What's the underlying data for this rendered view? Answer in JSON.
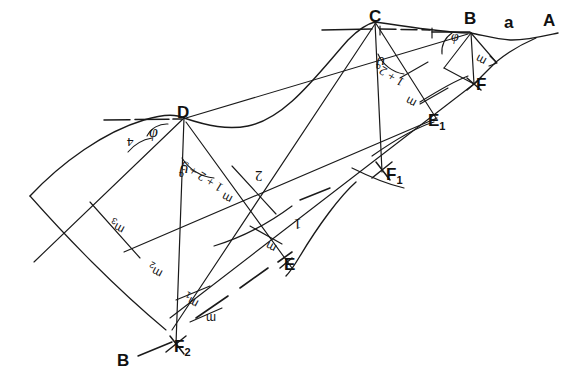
{
  "diagram": {
    "background_color": "#ffffff",
    "ink_color": "#1a1a1a",
    "points": [
      {
        "name": "A",
        "label": "A",
        "x": 545,
        "y": 22
      },
      {
        "name": "a",
        "label": "a",
        "x": 505,
        "y": 24
      },
      {
        "name": "B_top",
        "label": "B",
        "x": 470,
        "y": 20
      },
      {
        "name": "C",
        "label": "C",
        "x": 375,
        "y": 18
      },
      {
        "name": "D",
        "label": "D",
        "x": 183,
        "y": 114
      },
      {
        "name": "E",
        "label": "E",
        "x": 288,
        "y": 266
      },
      {
        "name": "E1",
        "label": "E",
        "sub": "1",
        "x": 432,
        "y": 122
      },
      {
        "name": "F",
        "label": "F",
        "x": 480,
        "y": 86
      },
      {
        "name": "F1",
        "label": "F",
        "sub": "1",
        "x": 390,
        "y": 176
      },
      {
        "name": "F2",
        "label": "F",
        "sub": "2",
        "x": 178,
        "y": 348
      },
      {
        "name": "B_bottom",
        "label": "B",
        "x": 123,
        "y": 362
      }
    ],
    "angle_labels": [
      {
        "name": "phi-at-D-surface",
        "text": "φ",
        "x": 152,
        "y": 131
      },
      {
        "name": "theta-at-D",
        "text": "ϑ",
        "x": 186,
        "y": 170
      },
      {
        "name": "theta-at-C",
        "text": "ϑ",
        "x": 382,
        "y": 62
      },
      {
        "name": "phi-at-B",
        "text": "φ",
        "x": 455,
        "y": 37
      },
      {
        "name": "four-at-D",
        "text": "4",
        "x": 131,
        "y": 143
      }
    ],
    "slice_labels": [
      {
        "name": "slice-1-plus-2-plus-3",
        "text": "1 + 2 + 3",
        "x": 196,
        "y": 188
      },
      {
        "name": "slice-1-plus-2",
        "text": "1 + 2",
        "x": 392,
        "y": 84
      },
      {
        "name": "slice-2",
        "text": "2",
        "x": 258,
        "y": 176
      },
      {
        "name": "slice-1",
        "text": "1",
        "x": 296,
        "y": 224
      }
    ],
    "measure_labels": [
      {
        "name": "m3",
        "text": "m",
        "sub": "3",
        "x": 118,
        "y": 226
      },
      {
        "name": "m2",
        "text": "m",
        "sub": "2",
        "x": 155,
        "y": 270
      },
      {
        "name": "m1",
        "text": "m",
        "sub": "1",
        "x": 190,
        "y": 300
      },
      {
        "name": "m-at-F2",
        "text": "m",
        "x": 211,
        "y": 320
      },
      {
        "name": "m-at-D-slice",
        "text": "m",
        "x": 228,
        "y": 200
      },
      {
        "name": "m-at-E",
        "text": "m",
        "x": 272,
        "y": 249
      },
      {
        "name": "m-at-C",
        "text": "m",
        "x": 412,
        "y": 104
      },
      {
        "name": "m-at-B",
        "text": "m",
        "x": 482,
        "y": 62
      }
    ],
    "caption": ""
  }
}
